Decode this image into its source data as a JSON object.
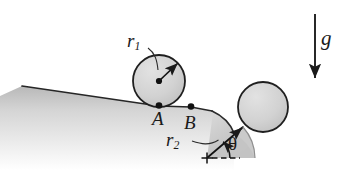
{
  "figure": {
    "type": "physics-mechanics-diagram",
    "background_color": "#ffffff",
    "ink_color": "#1a1a1a",
    "surface_fill_color": "#cfcfcf",
    "ball_fill_color": "#d2d2d2"
  },
  "labels": {
    "radius_small": {
      "base": "r",
      "sub": "1"
    },
    "radius_large": {
      "base": "r",
      "sub": "2"
    },
    "point_a": "A",
    "point_b": "B",
    "angle": "θ",
    "gravity": "g"
  },
  "objects": {
    "ball_small": {
      "name": "ball-on-incline",
      "center_x": 159,
      "center_y": 81,
      "radius": 26,
      "contact_point": {
        "x": 159,
        "y": 106,
        "label": "A"
      }
    },
    "ball_large": {
      "name": "ball-in-valley",
      "center_x": 263,
      "center_y": 107,
      "radius": 25,
      "contact_point": {
        "x": 243,
        "y": 127
      }
    },
    "point_b_marker": {
      "x": 191,
      "y": 107,
      "label": "B"
    },
    "valley_center": {
      "x": 207,
      "y": 158,
      "marker": "+"
    },
    "valley_radius": 48
  },
  "vectors": {
    "radius_arrow_small": {
      "name": "radius-arrow-r1",
      "from": {
        "x": 159,
        "y": 81
      },
      "to": {
        "x": 178,
        "y": 63
      }
    },
    "radius_arrow_large": {
      "name": "radius-arrow-r2",
      "from": {
        "x": 207,
        "y": 158
      },
      "to": {
        "x": 243,
        "y": 127
      }
    },
    "gravity_arrow": {
      "name": "gravity-arrow",
      "from": {
        "x": 315,
        "y": 14
      },
      "to": {
        "x": 315,
        "y": 80
      },
      "direction": "down"
    },
    "horizontal_reference": {
      "name": "horizontal-dashed-reference",
      "from": {
        "x": 211,
        "y": 158
      },
      "to": {
        "x": 240,
        "y": 158
      },
      "style": "dashed"
    }
  },
  "angle_arc": {
    "name": "theta-arc",
    "vertex": {
      "x": 207,
      "y": 158
    },
    "between": [
      "horizontal-dashed-reference",
      "radius-arrow-r2"
    ],
    "value_label": "θ"
  }
}
